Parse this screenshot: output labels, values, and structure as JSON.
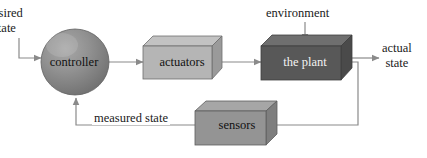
{
  "diagram": {
    "type": "block-diagram",
    "nodes": [
      {
        "id": "controller",
        "label": "controller",
        "shape": "sphere",
        "fill": "#8c8c8c"
      },
      {
        "id": "actuators",
        "label": "actuators",
        "shape": "box-3d",
        "fill": "#b3b3b3"
      },
      {
        "id": "plant",
        "label": "the plant",
        "shape": "box-3d",
        "fill": "#585858"
      },
      {
        "id": "sensors",
        "label": "sensors",
        "shape": "box-3d",
        "fill": "#949494"
      }
    ],
    "labels": {
      "desired_state_line1": "esired",
      "desired_state_line2": "state",
      "environment": "environment",
      "actual_state_line1": "actual",
      "actual_state_line2": "state",
      "measured_state": "measured state"
    },
    "edges": [
      {
        "from": "desired state",
        "to": "controller",
        "arrow": true
      },
      {
        "from": "controller",
        "to": "actuators",
        "arrow": true
      },
      {
        "from": "actuators",
        "to": "plant",
        "arrow": true
      },
      {
        "from": "environment",
        "to": "plant",
        "arrow": true
      },
      {
        "from": "plant",
        "to": "actual state",
        "arrow": true
      },
      {
        "from": "plant",
        "to": "sensors",
        "arrow": false
      },
      {
        "from": "sensors",
        "to": "controller",
        "arrow": true,
        "label": "measured state"
      }
    ],
    "colors": {
      "line": "#8a8a8a",
      "text": "#1a1a1a",
      "plant_text": "#f2f2f2",
      "background": "#ffffff"
    }
  }
}
